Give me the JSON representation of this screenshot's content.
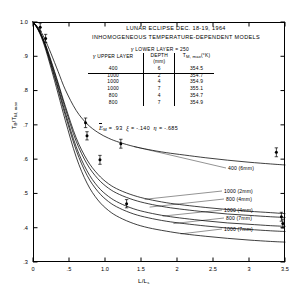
{
  "chart_data": {
    "type": "line",
    "title_lines": [
      "LUNAR ECLIPSE  DEC. 18-19, 1964",
      "INHOMOGENEOUS  TEMPERATURE-DEPENDENT  MODELS"
    ],
    "xlabel": "L/L",
    "xlabel_sub": "s",
    "ylabel": "T",
    "ylabel_sub1": "B",
    "ylabel_mid": "/T",
    "ylabel_sub2": "M, max",
    "xlim": [
      0,
      3.5
    ],
    "ylim": [
      0.3,
      1.0
    ],
    "xticks": [
      "0",
      ".5",
      "1.0",
      "1.5",
      "2",
      "2.5",
      "3",
      "3.5"
    ],
    "xtick_values": [
      0,
      0.5,
      1.0,
      1.5,
      2.0,
      2.5,
      3.0,
      3.5
    ],
    "yticks": [
      "1.0",
      ".9",
      ".8",
      ".7",
      ".6",
      ".5",
      ".4",
      ".3"
    ],
    "ytick_values": [
      1.0,
      0.9,
      0.8,
      0.7,
      0.6,
      0.5,
      0.4,
      0.3
    ],
    "grid": false,
    "legend_position": "right-inline",
    "series": [
      {
        "name": "400 (6mm)",
        "gamma": 400,
        "depth_mm": 6,
        "t_max": 354.5,
        "x": [
          0,
          0.08,
          0.16,
          0.25,
          0.35,
          0.45,
          0.6,
          0.75,
          0.9,
          1.05,
          1.2,
          1.4,
          1.6,
          1.85,
          2.1,
          2.4,
          2.7,
          3.0,
          3.3,
          3.5
        ],
        "y": [
          1.0,
          0.982,
          0.952,
          0.908,
          0.855,
          0.802,
          0.742,
          0.703,
          0.678,
          0.661,
          0.649,
          0.637,
          0.628,
          0.619,
          0.612,
          0.604,
          0.597,
          0.591,
          0.586,
          0.583
        ]
      },
      {
        "name": "1000 (2mm)",
        "gamma": 1000,
        "depth_mm": 2,
        "t_max": 354.7,
        "x": [
          0,
          0.08,
          0.16,
          0.25,
          0.35,
          0.45,
          0.6,
          0.75,
          0.9,
          1.05,
          1.2,
          1.4,
          1.6,
          1.85,
          2.1,
          2.4,
          2.7,
          3.0,
          3.3,
          3.5
        ],
        "y": [
          1.0,
          0.978,
          0.942,
          0.888,
          0.822,
          0.754,
          0.662,
          0.598,
          0.556,
          0.528,
          0.51,
          0.494,
          0.483,
          0.473,
          0.466,
          0.459,
          0.453,
          0.448,
          0.444,
          0.441
        ]
      },
      {
        "name": "800 (4mm)",
        "gamma": 800,
        "depth_mm": 4,
        "t_max": 354.7,
        "x": [
          0,
          0.08,
          0.16,
          0.25,
          0.35,
          0.45,
          0.6,
          0.75,
          0.9,
          1.05,
          1.2,
          1.4,
          1.6,
          1.85,
          2.1,
          2.4,
          2.7,
          3.0,
          3.3,
          3.5
        ],
        "y": [
          1.0,
          0.977,
          0.94,
          0.884,
          0.817,
          0.747,
          0.652,
          0.586,
          0.543,
          0.515,
          0.497,
          0.481,
          0.47,
          0.46,
          0.453,
          0.446,
          0.44,
          0.436,
          0.432,
          0.43
        ]
      },
      {
        "name": "1000 (4mm)",
        "gamma": 1000,
        "depth_mm": 4,
        "t_max": 354.9,
        "x": [
          0,
          0.08,
          0.16,
          0.25,
          0.35,
          0.45,
          0.6,
          0.75,
          0.9,
          1.05,
          1.2,
          1.4,
          1.6,
          1.85,
          2.1,
          2.4,
          2.7,
          3.0,
          3.3,
          3.5
        ],
        "y": [
          1.0,
          0.976,
          0.937,
          0.878,
          0.808,
          0.735,
          0.636,
          0.566,
          0.52,
          0.491,
          0.472,
          0.455,
          0.444,
          0.434,
          0.427,
          0.42,
          0.414,
          0.41,
          0.406,
          0.404
        ]
      },
      {
        "name": "800 (7mm)",
        "gamma": 800,
        "depth_mm": 7,
        "t_max": 354.9,
        "x": [
          0,
          0.08,
          0.16,
          0.25,
          0.35,
          0.45,
          0.6,
          0.75,
          0.9,
          1.05,
          1.2,
          1.4,
          1.6,
          1.85,
          2.1,
          2.4,
          2.7,
          3.0,
          3.3,
          3.5
        ],
        "y": [
          1.0,
          0.975,
          0.935,
          0.874,
          0.802,
          0.727,
          0.626,
          0.553,
          0.506,
          0.476,
          0.457,
          0.44,
          0.429,
          0.419,
          0.412,
          0.405,
          0.399,
          0.395,
          0.391,
          0.389
        ]
      },
      {
        "name": "1000 (7mm)",
        "gamma": 1000,
        "depth_mm": 7,
        "t_max": 355.1,
        "x": [
          0,
          0.08,
          0.16,
          0.25,
          0.35,
          0.45,
          0.6,
          0.75,
          0.9,
          1.05,
          1.2,
          1.4,
          1.6,
          1.85,
          2.1,
          2.4,
          2.7,
          3.0,
          3.3,
          3.5
        ],
        "y": [
          1.0,
          0.973,
          0.93,
          0.866,
          0.79,
          0.712,
          0.606,
          0.53,
          0.481,
          0.45,
          0.43,
          0.412,
          0.4,
          0.39,
          0.382,
          0.375,
          0.369,
          0.364,
          0.36,
          0.358
        ]
      }
    ],
    "observations": [
      {
        "x": 0.1,
        "y": 0.985,
        "err": 0.012
      },
      {
        "x": 0.175,
        "y": 0.952,
        "err": 0.012
      },
      {
        "x": 0.73,
        "y": 0.706,
        "err": 0.014
      },
      {
        "x": 0.75,
        "y": 0.668,
        "err": 0.012
      },
      {
        "x": 0.93,
        "y": 0.598,
        "err": 0.013
      },
      {
        "x": 1.22,
        "y": 0.645,
        "err": 0.013
      },
      {
        "x": 1.3,
        "y": 0.47,
        "err": 0.012
      },
      {
        "x": 3.38,
        "y": 0.62,
        "err": 0.013
      },
      {
        "x": 3.45,
        "y": 0.432,
        "err": 0.013
      },
      {
        "x": 3.47,
        "y": 0.412,
        "err": 0.013
      }
    ]
  },
  "header": {
    "gamma_symbol": "γ",
    "lower_layer_label": "LOWER  LAYER = 250"
  },
  "legend": {
    "columns": [
      "UPPER LAYER",
      "DEPTH",
      "T"
    ],
    "col0_symbol": "γ",
    "col1_unit": "(mm)",
    "col2_sub": "M, max",
    "col2_unit": "(°K)",
    "rows": [
      {
        "gamma": "400",
        "depth": "6",
        "tmax": "354.5"
      },
      {
        "gamma": "1000",
        "depth": "2",
        "tmax": "354.7"
      },
      {
        "gamma": "1000",
        "depth": "4",
        "tmax": "354.9"
      },
      {
        "gamma": "1000",
        "depth": "7",
        "tmax": "355.1"
      },
      {
        "gamma": "800",
        "depth": "4",
        "tmax": "354.7"
      },
      {
        "gamma": "800",
        "depth": "7",
        "tmax": "354.9"
      }
    ]
  },
  "params": {
    "e_symbol": "E",
    "e_sub": "M",
    "e_value": "= .93",
    "xi_symbol": "ξ",
    "xi_value": "= -.140",
    "eta_symbol": "η",
    "eta_value": "= -.685"
  },
  "curve_labels": [
    {
      "text": "400 (6mm)"
    },
    {
      "text": "1000 (2mm)"
    },
    {
      "text": "800 (4mm)"
    },
    {
      "text": "1000 (4mm)"
    },
    {
      "text": "800 (7mm)"
    },
    {
      "text": "1000 (7mm)"
    }
  ],
  "colors": {
    "ink": "#000000",
    "background": "#ffffff"
  }
}
